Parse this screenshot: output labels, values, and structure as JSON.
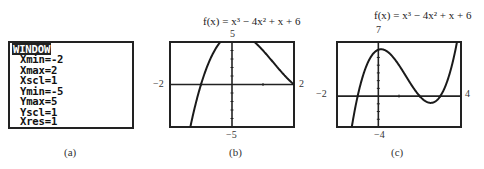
{
  "panel_a": {
    "caption": "(a)",
    "title": "WINDOW",
    "lines": [
      "Xmin=-2",
      "Xmax=2",
      "Xscl=1",
      "Ymin=-5",
      "Ymax=5",
      "Yscl=1",
      "Xres=1"
    ]
  },
  "panel_b": {
    "caption": "(b)",
    "formula": "f(x) = x³ − 4x² + x + 6",
    "ymax_label": "5",
    "ymin_label": "−5",
    "xmin_label": "−2",
    "xmax_label": "2"
  },
  "panel_c": {
    "caption": "(c)",
    "formula": "f(x) = x³ − 4x² + x + 6",
    "ymax_label": "7",
    "ymin_label": "−4",
    "xmin_label": "−2",
    "xmax_label": "4"
  },
  "chart_data": [
    {
      "type": "line",
      "title": "f(x) = x^3 - 4x^2 + x + 6",
      "function": "x^3 - 4x^2 + x + 6",
      "xlim": [
        -2,
        2
      ],
      "ylim": [
        -5,
        5
      ],
      "xscl": 1,
      "yscl": 1,
      "x": [
        -2,
        -1.5,
        -1,
        -0.5,
        0,
        0.5,
        1,
        1.5,
        2
      ],
      "y": [
        -20,
        -6.375,
        0,
        4.375,
        6,
        5.625,
        4,
        1.875,
        0
      ],
      "grid": false,
      "caption": "(b)"
    },
    {
      "type": "line",
      "title": "f(x) = x^3 - 4x^2 + x + 6",
      "function": "x^3 - 4x^2 + x + 6",
      "xlim": [
        -2,
        4
      ],
      "ylim": [
        -4,
        7
      ],
      "xscl": 1,
      "yscl": 1,
      "x": [
        -2,
        -1.5,
        -1,
        -0.5,
        0,
        0.5,
        1,
        1.5,
        2,
        2.5,
        3,
        3.5,
        4
      ],
      "y": [
        -20,
        -6.375,
        0,
        4.375,
        6,
        5.625,
        4,
        1.875,
        0,
        -0.875,
        0,
        3.375,
        10
      ],
      "grid": false,
      "caption": "(c)"
    }
  ]
}
